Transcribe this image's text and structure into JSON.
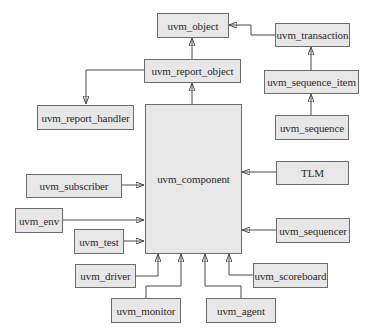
{
  "diagram": {
    "type": "class-hierarchy",
    "nodes": [
      {
        "id": "uvm_object",
        "label": "uvm_object"
      },
      {
        "id": "uvm_transaction",
        "label": "uvm_transaction"
      },
      {
        "id": "uvm_report_object",
        "label": "uvm_report_object"
      },
      {
        "id": "uvm_sequence_item",
        "label": "uvm_sequence_item"
      },
      {
        "id": "uvm_report_handler",
        "label": "uvm_report_handler"
      },
      {
        "id": "uvm_sequence",
        "label": "uvm_sequence"
      },
      {
        "id": "uvm_component",
        "label": "uvm_component"
      },
      {
        "id": "tlm",
        "label": "TLM"
      },
      {
        "id": "uvm_subscriber",
        "label": "uvm_subscriber"
      },
      {
        "id": "uvm_env",
        "label": "uvm_env"
      },
      {
        "id": "uvm_test",
        "label": "uvm_test"
      },
      {
        "id": "uvm_sequencer",
        "label": "uvm_sequencer"
      },
      {
        "id": "uvm_driver",
        "label": "uvm_driver"
      },
      {
        "id": "uvm_scoreboard",
        "label": "uvm_scoreboard"
      },
      {
        "id": "uvm_monitor",
        "label": "uvm_monitor"
      },
      {
        "id": "uvm_agent",
        "label": "uvm_agent"
      }
    ],
    "edges": [
      {
        "from": "uvm_transaction",
        "to": "uvm_object"
      },
      {
        "from": "uvm_report_object",
        "to": "uvm_object"
      },
      {
        "from": "uvm_sequence_item",
        "to": "uvm_transaction"
      },
      {
        "from": "uvm_sequence",
        "to": "uvm_sequence_item"
      },
      {
        "from": "uvm_report_object",
        "to": "uvm_report_handler"
      },
      {
        "from": "uvm_component",
        "to": "uvm_report_object"
      },
      {
        "from": "tlm",
        "to": "uvm_component"
      },
      {
        "from": "uvm_subscriber",
        "to": "uvm_component"
      },
      {
        "from": "uvm_env",
        "to": "uvm_component"
      },
      {
        "from": "uvm_test",
        "to": "uvm_component"
      },
      {
        "from": "uvm_sequencer",
        "to": "uvm_component"
      },
      {
        "from": "uvm_driver",
        "to": "uvm_component"
      },
      {
        "from": "uvm_monitor",
        "to": "uvm_component"
      },
      {
        "from": "uvm_agent",
        "to": "uvm_component"
      },
      {
        "from": "uvm_scoreboard",
        "to": "uvm_component"
      }
    ]
  },
  "labels": {
    "uvm_object": "uvm_object",
    "uvm_transaction": "uvm_transaction",
    "uvm_report_object": "uvm_report_object",
    "uvm_sequence_item": "uvm_sequence_item",
    "uvm_report_handler": "uvm_report_handler",
    "uvm_sequence": "uvm_sequence",
    "uvm_component": "uvm_component",
    "tlm": "TLM",
    "uvm_subscriber": "uvm_subscriber",
    "uvm_env": "uvm_env",
    "uvm_test": "uvm_test",
    "uvm_sequencer": "uvm_sequencer",
    "uvm_driver": "uvm_driver",
    "uvm_scoreboard": "uvm_scoreboard",
    "uvm_monitor": "uvm_monitor",
    "uvm_agent": "uvm_agent"
  },
  "colors": {
    "box_fill": "#e7e7e7",
    "box_border": "#6b6b6b",
    "line": "#4a4a4a",
    "text": "#2a2a2a"
  }
}
